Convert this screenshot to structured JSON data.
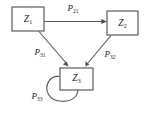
{
  "diagram": {
    "type": "state-transition-diagram",
    "background_color": "#ffffff",
    "stroke_color": "#565656",
    "text_color": "#1a1a1a",
    "nodes": [
      {
        "id": "z1",
        "label_base": "Z",
        "label_sub": "1",
        "label_full": "Z1",
        "x": 12,
        "y": 7,
        "width": 32,
        "height": 24
      },
      {
        "id": "z2",
        "label_base": "Z",
        "label_sub": "2",
        "label_full": "Z2",
        "x": 107,
        "y": 11,
        "width": 31,
        "height": 24
      },
      {
        "id": "z3",
        "label_base": "Z",
        "label_sub": "3",
        "label_full": "Z3",
        "x": 60,
        "y": 68,
        "width": 33,
        "height": 22
      }
    ],
    "edges": [
      {
        "id": "e21",
        "from": "z1",
        "to": "z2",
        "label_base": "P",
        "label_sub": "21",
        "label_full": "P21",
        "shape": "straight-horizontal"
      },
      {
        "id": "e31",
        "from": "z1",
        "to": "z3",
        "label_base": "P",
        "label_sub": "31",
        "label_full": "P31",
        "shape": "straight-diagonal"
      },
      {
        "id": "e32",
        "from": "z2",
        "to": "z3",
        "label_base": "P",
        "label_sub": "32",
        "label_full": "P32",
        "shape": "straight-diagonal"
      },
      {
        "id": "e33",
        "from": "z3",
        "to": "z3",
        "label_base": "P",
        "label_sub": "33",
        "label_full": "P33",
        "shape": "self-loop"
      }
    ]
  }
}
